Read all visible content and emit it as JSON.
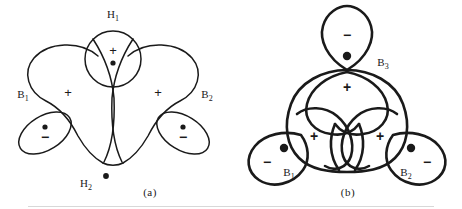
{
  "figure": {
    "background_color": "#ffffff",
    "stroke_color": "#1a1a1a"
  },
  "panels": [
    {
      "id": "a",
      "caption": "(a)",
      "atom_labels": [
        {
          "id": "H1",
          "base": "H",
          "sub": "1",
          "x": 113,
          "y": 18
        },
        {
          "id": "B1",
          "base": "B",
          "sub": "1",
          "x": 23,
          "y": 98
        },
        {
          "id": "B2",
          "base": "B",
          "sub": "2",
          "x": 207,
          "y": 98
        },
        {
          "id": "H2",
          "base": "H",
          "sub": "2",
          "x": 86,
          "y": 187
        }
      ],
      "signs": [
        {
          "symbol": "+",
          "x": 113,
          "y": 52
        },
        {
          "symbol": "+",
          "x": 68,
          "y": 94
        },
        {
          "symbol": "+",
          "x": 158,
          "y": 94
        },
        {
          "symbol": "−",
          "x": 45,
          "y": 137
        },
        {
          "symbol": "−",
          "x": 183,
          "y": 137
        }
      ],
      "nuclei": [
        {
          "label": "H1-nucleus",
          "x": 113,
          "y": 63,
          "r": 2.6
        },
        {
          "label": "B1-nucleus",
          "x": 45,
          "y": 127,
          "r": 2.6
        },
        {
          "label": "B2-nucleus",
          "x": 183,
          "y": 127,
          "r": 2.6
        },
        {
          "label": "H2-nucleus",
          "x": 106,
          "y": 176,
          "r": 2.9
        }
      ]
    },
    {
      "id": "b",
      "caption": "(b)",
      "atom_labels": [
        {
          "id": "B3",
          "base": "B",
          "sub": "3",
          "x": 152,
          "y": 66
        },
        {
          "id": "B1",
          "base": "B",
          "sub": "1",
          "x": 58,
          "y": 176
        },
        {
          "id": "B2",
          "base": "B",
          "sub": "2",
          "x": 175,
          "y": 176
        }
      ],
      "signs": [
        {
          "symbol": "−",
          "x": 116,
          "y": 35
        },
        {
          "symbol": "+",
          "x": 116,
          "y": 88
        },
        {
          "symbol": "+",
          "x": 83,
          "y": 137
        },
        {
          "symbol": "+",
          "x": 149,
          "y": 137
        },
        {
          "symbol": "−",
          "x": 36,
          "y": 162
        },
        {
          "symbol": "−",
          "x": 196,
          "y": 162
        }
      ],
      "nuclei": [
        {
          "label": "B3-nucleus",
          "x": 116,
          "y": 56,
          "r": 4.2
        },
        {
          "label": "B1-nucleus",
          "x": 53,
          "y": 148,
          "r": 4.2
        },
        {
          "label": "B2-nucleus",
          "x": 180,
          "y": 148,
          "r": 4.2
        }
      ]
    }
  ],
  "bottom_artifact": {
    "present": true,
    "color": "#d8d8d8"
  }
}
